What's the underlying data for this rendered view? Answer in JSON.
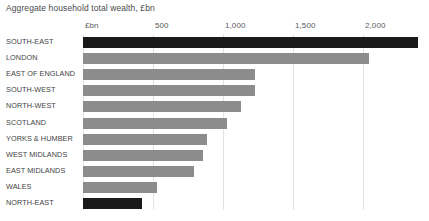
{
  "chart_data": {
    "type": "bar",
    "orientation": "horizontal",
    "title": "Aggregate household total wealth, £bn",
    "xlabel": "£bn",
    "ylabel": "",
    "xlim": [
      0,
      2500
    ],
    "grid": true,
    "legend": false,
    "axis_unit_label": "£bn",
    "tick_labels": [
      "£bn",
      "500",
      "1,000",
      "1,500",
      "2,000"
    ],
    "tick_values": [
      0,
      500,
      1000,
      1500,
      2000
    ],
    "categories": [
      "SOUTH-EAST",
      "LONDON",
      "EAST OF ENGLAND",
      "SOUTH-WEST",
      "NORTH-WEST",
      "SCOTLAND",
      "YORKS & HUMBER",
      "WEST MIDLANDS",
      "EAST MIDLANDS",
      "WALES",
      "NORTH-EAST"
    ],
    "values": [
      2390,
      2040,
      1230,
      1230,
      1130,
      1030,
      885,
      860,
      795,
      530,
      420
    ],
    "bar_colors": [
      "#1a1a1a",
      "#8c8c8c",
      "#8c8c8c",
      "#8c8c8c",
      "#8c8c8c",
      "#8c8c8c",
      "#8c8c8c",
      "#8c8c8c",
      "#8c8c8c",
      "#8c8c8c",
      "#1a1a1a"
    ],
    "colors": {
      "highlight": "#1a1a1a",
      "default_bar": "#8c8c8c",
      "gridline": "#e3e3e3",
      "background": "#ffffff",
      "text": "#3f3f3f"
    }
  }
}
